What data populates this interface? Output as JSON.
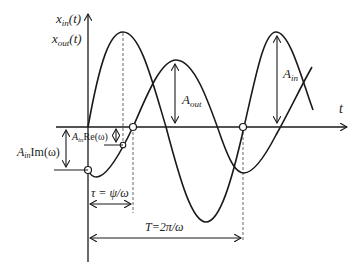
{
  "axes": {
    "y_label_in": "x",
    "y_label_in_sub": "in",
    "y_label_in_arg": "(t)",
    "y_label_out": "x",
    "y_label_out_sub": "out",
    "y_label_out_arg": "(t)",
    "x_label": "t"
  },
  "annotations": {
    "a_in": "A",
    "a_in_sub": "in",
    "a_out": "A",
    "a_out_sub": "out",
    "re_prefix": "A",
    "re_sub": "in",
    "re_text": "Re(ω)",
    "im_prefix": "A",
    "im_sub": "in",
    "im_text": "Im(ω)",
    "tau": "τ = ψ/ω",
    "period": "T=2π/ω"
  },
  "colors": {
    "stroke": "#1a1a1a",
    "dashed": "#555555",
    "background": "#ffffff"
  }
}
